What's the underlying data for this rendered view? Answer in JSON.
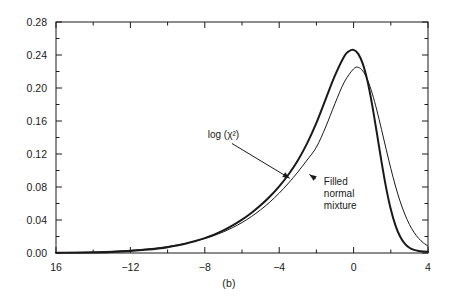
{
  "caption": "(b)",
  "chart_data": {
    "type": "line",
    "title": "",
    "xlabel": "",
    "ylabel": "",
    "xlim": [
      -16,
      4
    ],
    "ylim": [
      0.0,
      0.28
    ],
    "xticks": [
      -16,
      -12,
      -8,
      -4,
      0,
      4
    ],
    "xtick_labels": [
      "16",
      "−12",
      "−8",
      "−4",
      "0",
      "4"
    ],
    "yticks": [
      0.0,
      0.04,
      0.08,
      0.12,
      0.16,
      0.2,
      0.24,
      0.28
    ],
    "ytick_labels": [
      "0.00",
      "0.04",
      "0.08",
      "0.12",
      "0.16",
      "0.20",
      "0.24",
      "0.28"
    ],
    "minor_tick_step_x": 2,
    "minor_tick_step_y": 0.02,
    "grid": false,
    "legend": "none",
    "annotations": [
      {
        "name": "log-chi-squared",
        "text": "log (χ²)",
        "text_x": -7.0,
        "text_y": 0.139,
        "arrow_to_x": -3.25,
        "arrow_to_y": 0.088
      },
      {
        "name": "filled-normal-mixture",
        "lines": [
          "Filled",
          "normal",
          "mixture"
        ],
        "text_x": -1.6,
        "text_y": 0.083,
        "arrow_to_x": -2.55,
        "arrow_to_y": 0.098
      }
    ],
    "series": [
      {
        "name": "log (χ²)",
        "style": "thin",
        "color": "#1a1a1a",
        "width": 1.0,
        "x": [
          -16.0,
          -15.0,
          -14.0,
          -13.0,
          -12.0,
          -11.0,
          -10.5,
          -10.0,
          -9.5,
          -9.0,
          -8.5,
          -8.0,
          -7.5,
          -7.0,
          -6.5,
          -6.0,
          -5.5,
          -5.0,
          -4.5,
          -4.0,
          -3.5,
          -3.0,
          -2.5,
          -2.0,
          -1.5,
          -1.0,
          -0.5,
          0.0,
          0.25,
          0.5,
          0.75,
          1.0,
          1.25,
          1.5,
          1.75,
          2.0,
          2.25,
          2.5,
          2.75,
          3.0,
          3.25,
          3.5,
          3.75,
          4.0
        ],
        "y": [
          0.0005,
          0.0008,
          0.0013,
          0.0021,
          0.0033,
          0.0051,
          0.0063,
          0.0078,
          0.0096,
          0.0118,
          0.0144,
          0.0175,
          0.0212,
          0.0256,
          0.0308,
          0.0369,
          0.0441,
          0.0523,
          0.0618,
          0.0726,
          0.0847,
          0.0981,
          0.1127,
          0.1283,
          0.1528,
          0.1812,
          0.2072,
          0.2232,
          0.225,
          0.2205,
          0.2098,
          0.1935,
          0.173,
          0.1498,
          0.1258,
          0.1025,
          0.0812,
          0.0627,
          0.0472,
          0.0347,
          0.025,
          0.0177,
          0.0123,
          0.0084
        ]
      },
      {
        "name": "Filled normal mixture",
        "style": "thick",
        "color": "#1a1a1a",
        "width": 2.0,
        "x": [
          -16.0,
          -15.0,
          -14.0,
          -13.0,
          -12.0,
          -11.0,
          -10.5,
          -10.0,
          -9.5,
          -9.0,
          -8.5,
          -8.0,
          -7.5,
          -7.0,
          -6.5,
          -6.0,
          -5.5,
          -5.0,
          -4.5,
          -4.0,
          -3.5,
          -3.0,
          -2.5,
          -2.0,
          -1.5,
          -1.0,
          -0.5,
          -0.25,
          0.0,
          0.25,
          0.5,
          0.75,
          1.0,
          1.25,
          1.5,
          1.75,
          2.0,
          2.25,
          2.5,
          2.75,
          3.0,
          3.25,
          3.5,
          3.75,
          4.0
        ],
        "y": [
          0.0002,
          0.0004,
          0.0007,
          0.0013,
          0.0024,
          0.0042,
          0.0055,
          0.0071,
          0.0091,
          0.0115,
          0.0145,
          0.018,
          0.0223,
          0.0274,
          0.0334,
          0.0404,
          0.0485,
          0.0578,
          0.0685,
          0.0808,
          0.0952,
          0.1122,
          0.1329,
          0.1578,
          0.1866,
          0.2152,
          0.2385,
          0.2446,
          0.2462,
          0.2414,
          0.229,
          0.208,
          0.1793,
          0.1455,
          0.1108,
          0.079,
          0.053,
          0.0335,
          0.02,
          0.0114,
          0.0064,
          0.0038,
          0.0025,
          0.0019,
          0.0016
        ]
      }
    ]
  }
}
